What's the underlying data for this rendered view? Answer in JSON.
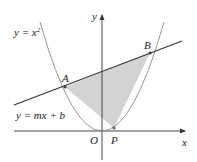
{
  "diagram": {
    "title": "",
    "labels": {
      "parabola_eq": "y = x",
      "parabola_exp": "2",
      "line_eq": "y = mx + b",
      "point_a": "A",
      "point_b": "B",
      "point_p": "P",
      "origin": "O",
      "x_axis": "x",
      "y_axis": "y"
    },
    "elements": [
      {
        "type": "axis",
        "name": "x-axis",
        "from": [
          14,
          131
        ],
        "to": [
          185,
          131
        ]
      },
      {
        "type": "axis",
        "name": "y-axis",
        "from": [
          102,
          160
        ],
        "to": [
          102,
          14
        ]
      },
      {
        "type": "curve",
        "name": "parabola",
        "equation": "y = x^2"
      },
      {
        "type": "line",
        "name": "secant-line",
        "equation": "y = mx + b"
      },
      {
        "type": "point",
        "name": "A",
        "on": [
          "parabola",
          "line"
        ]
      },
      {
        "type": "point",
        "name": "B",
        "on": [
          "parabola",
          "line"
        ]
      },
      {
        "type": "point",
        "name": "P",
        "on": [
          "parabola"
        ]
      },
      {
        "type": "region",
        "name": "triangle-APB",
        "fill": "#d4d4d4"
      }
    ],
    "colors": {
      "axis": "#333333",
      "curve": "#8a8a8a",
      "line": "#333333",
      "shade": "#d3d3d3",
      "point": "#555555"
    }
  }
}
